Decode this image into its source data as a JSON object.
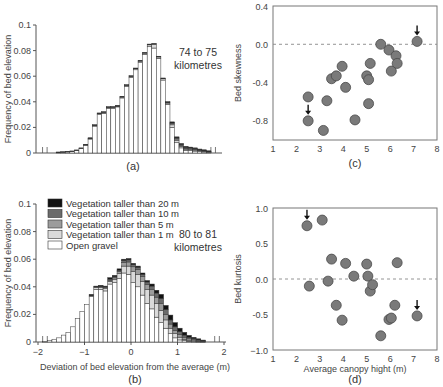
{
  "chart_data": [
    {
      "id": "a",
      "type": "bar",
      "stacked": true,
      "caption": "(a)",
      "annotation": [
        "74 to 75",
        "kilometres"
      ],
      "ylabel": "Frequency of bed elevation",
      "xlabel": "",
      "ylim": [
        0,
        0.1
      ],
      "yticks": [
        "0",
        "0.02",
        "0.04",
        "0.06",
        "0.08",
        "0.1"
      ],
      "xlim": [
        -2,
        2
      ],
      "bin_width": 0.1,
      "x_start": -1.8,
      "series": [
        {
          "name": "Open gravel",
          "values": [
            0,
            0,
            0.0005,
            0.0007,
            0.0009,
            0.0012,
            0.002,
            0.0035,
            0.006,
            0.011,
            0.021,
            0.03,
            0.031,
            0.035,
            0.035,
            0.036,
            0.043,
            0.052,
            0.059,
            0.065,
            0.071,
            0.077,
            0.083,
            0.082,
            0.074,
            0.057,
            0.038,
            0.02,
            0.008,
            0.004,
            0.002,
            0.002,
            0.0015,
            0.001,
            0.0008,
            0.0005,
            0,
            0
          ]
        },
        {
          "name": "Vegetation taller than 1 m",
          "values": [
            0,
            0,
            0,
            0,
            0,
            0,
            0,
            0,
            0.0002,
            0.0003,
            0.0005,
            0.0007,
            0.0007,
            0.0006,
            0.0007,
            0.0006,
            0.0007,
            0.0008,
            0.0008,
            0.0008,
            0.0008,
            0.001,
            0.0015,
            0.003,
            0.001,
            0.001,
            0.001,
            0.002,
            0.002,
            0.001,
            0.001,
            0.0008,
            0.0008,
            0.0006,
            0.0005,
            0.0004,
            0,
            0
          ]
        },
        {
          "name": "Vegetation taller than 5 m",
          "values": [
            0,
            0,
            0,
            0,
            0,
            0,
            0,
            0,
            0,
            0,
            0,
            0,
            0,
            0,
            0,
            0,
            0,
            0,
            0,
            0,
            0,
            0,
            0,
            0,
            0,
            0,
            0.0005,
            0.001,
            0.001,
            0.0008,
            0.0006,
            0.0006,
            0.0005,
            0.0005,
            0.0004,
            0.0003,
            0,
            0
          ]
        },
        {
          "name": "Vegetation taller than 10 m",
          "values": [
            0,
            0,
            0,
            0,
            0,
            0,
            0,
            0,
            0,
            0,
            0,
            0,
            0,
            0,
            0,
            0,
            0,
            0,
            0,
            0,
            0,
            0,
            0,
            0,
            0,
            0,
            0,
            0.0005,
            0.0008,
            0.0008,
            0.0008,
            0.0006,
            0.0006,
            0.0005,
            0.0004,
            0.0002,
            0,
            0
          ]
        },
        {
          "name": "Vegetation taller than 20 m",
          "values": [
            0,
            0,
            0.0003,
            0.0003,
            0.0003,
            0.0004,
            0.0004,
            0.0005,
            0.0006,
            0.0006,
            0.0006,
            0.0006,
            0.0006,
            0.0006,
            0.0006,
            0.0006,
            0.0006,
            0.0006,
            0.0006,
            0.0006,
            0.0006,
            0.0006,
            0.0006,
            0.0006,
            0.0006,
            0.0006,
            0.0006,
            0.0008,
            0.0008,
            0.0008,
            0.0008,
            0.0006,
            0.0006,
            0.0005,
            0.0004,
            0.0003,
            0,
            0
          ]
        }
      ]
    },
    {
      "id": "b",
      "type": "bar",
      "stacked": true,
      "caption": "(b)",
      "annotation": [
        "80 to 81",
        "kilometres"
      ],
      "ylabel": "Frequency of bed elevation",
      "xlabel": "Deviation of bed elevation from the average (m)",
      "ylim": [
        0,
        0.1
      ],
      "yticks": [
        "0",
        "0.02",
        "0.04",
        "0.06",
        "0.08",
        "0.1"
      ],
      "xlim": [
        -2,
        2
      ],
      "xticks": [
        "−2",
        "−1",
        "0",
        "1",
        "2"
      ],
      "bin_width": 0.1,
      "x_start": -1.9,
      "legend": [
        {
          "label": "Vegetation taller than 20 m",
          "color": "#111111"
        },
        {
          "label": "Vegetation taller than 10 m",
          "color": "#6b6b6b"
        },
        {
          "label": "Vegetation taller than 5 m",
          "color": "#9c9c9c"
        },
        {
          "label": "Vegetation taller than 1 m",
          "color": "#dadada"
        },
        {
          "label": "Open gravel",
          "color": "#ffffff"
        }
      ],
      "series": [
        {
          "name": "Open gravel",
          "values": [
            0.0003,
            0.001,
            0.002,
            0.003,
            0.005,
            0.007,
            0.011,
            0.017,
            0.022,
            0.027,
            0.033,
            0.038,
            0.038,
            0.037,
            0.042,
            0.043,
            0.046,
            0.05,
            0.049,
            0.043,
            0.04,
            0.034,
            0.028,
            0.024,
            0.018,
            0.014,
            0.01,
            0.006,
            0.003,
            0.0015,
            0.001,
            0.0005,
            0.0003,
            0.0002,
            0.0001,
            0
          ]
        },
        {
          "name": "Vegetation taller than 1 m",
          "values": [
            0,
            0,
            0,
            0,
            0,
            0,
            0,
            0,
            0,
            0,
            0.0005,
            0.0015,
            0.0015,
            0.002,
            0.002,
            0.0025,
            0.0035,
            0.005,
            0.006,
            0.008,
            0.009,
            0.01,
            0.01,
            0.01,
            0.01,
            0.009,
            0.006,
            0.004,
            0.003,
            0.002,
            0.001,
            0.0008,
            0.0005,
            0.0003,
            0.0002,
            0
          ]
        },
        {
          "name": "Vegetation taller than 5 m",
          "values": [
            0,
            0,
            0,
            0,
            0,
            0,
            0,
            0,
            0,
            0,
            0,
            0,
            0.0005,
            0.0005,
            0.0008,
            0.001,
            0.0015,
            0.0025,
            0.003,
            0.0035,
            0.0035,
            0.0035,
            0.0035,
            0.004,
            0.0045,
            0.005,
            0.004,
            0.003,
            0.0025,
            0.002,
            0.0015,
            0.001,
            0.0008,
            0.0005,
            0.0003,
            0
          ]
        },
        {
          "name": "Vegetation taller than 10 m",
          "values": [
            0,
            0,
            0,
            0,
            0,
            0,
            0,
            0,
            0,
            0,
            0,
            0.0005,
            0.0005,
            0.0005,
            0.0008,
            0.0008,
            0.001,
            0.0015,
            0.0015,
            0.0015,
            0.0015,
            0.0015,
            0.002,
            0.0025,
            0.003,
            0.0035,
            0.0035,
            0.003,
            0.0025,
            0.002,
            0.0015,
            0.001,
            0.0008,
            0.0005,
            0.0003,
            0
          ]
        },
        {
          "name": "Vegetation taller than 20 m",
          "values": [
            0,
            0,
            0,
            0,
            0,
            0,
            0,
            0,
            0,
            0,
            0.001,
            0.0005,
            0.0005,
            0.0005,
            0.001,
            0.001,
            0.001,
            0.001,
            0.001,
            0.001,
            0.001,
            0.001,
            0.001,
            0.0015,
            0.002,
            0.003,
            0.003,
            0.0035,
            0.003,
            0.0025,
            0.002,
            0.0015,
            0.001,
            0.0008,
            0.0005,
            0
          ]
        }
      ]
    },
    {
      "id": "c",
      "type": "scatter",
      "caption": "(c)",
      "ylabel": "Bed skewness",
      "xlabel": "",
      "xlim": [
        1,
        8
      ],
      "ylim": [
        -1.0,
        0.4
      ],
      "xticks": [
        "1",
        "2",
        "3",
        "4",
        "5",
        "6",
        "7",
        "8"
      ],
      "yticks": [
        {
          "v": 0.4,
          "label": "0.4"
        },
        {
          "v": 0.0,
          "label": "0.0"
        },
        {
          "v": -0.4,
          "label": "-0.4"
        },
        {
          "v": -0.8,
          "label": "-0.8"
        }
      ],
      "reference_line": 0.0,
      "points": [
        {
          "x": 2.5,
          "y": -0.55
        },
        {
          "x": 2.5,
          "y": -0.8,
          "arrow": true
        },
        {
          "x": 3.15,
          "y": -0.9
        },
        {
          "x": 3.3,
          "y": -0.59
        },
        {
          "x": 3.5,
          "y": -0.36
        },
        {
          "x": 3.7,
          "y": -0.33
        },
        {
          "x": 3.95,
          "y": -0.23
        },
        {
          "x": 4.1,
          "y": -0.45
        },
        {
          "x": 4.5,
          "y": -0.79
        },
        {
          "x": 5.0,
          "y": -0.33
        },
        {
          "x": 5.08,
          "y": -0.37
        },
        {
          "x": 5.08,
          "y": -0.62
        },
        {
          "x": 5.15,
          "y": -0.2
        },
        {
          "x": 5.6,
          "y": 0.0
        },
        {
          "x": 5.95,
          "y": -0.06
        },
        {
          "x": 6.05,
          "y": -0.28
        },
        {
          "x": 6.25,
          "y": -0.12
        },
        {
          "x": 6.3,
          "y": -0.2
        },
        {
          "x": 7.15,
          "y": 0.03,
          "arrow": true
        }
      ]
    },
    {
      "id": "d",
      "type": "scatter",
      "caption": "(d)",
      "ylabel": "Bed kurtosis",
      "xlabel": "Average canopy hight (m)",
      "xlim": [
        1,
        8
      ],
      "ylim": [
        -1.0,
        1.0
      ],
      "xticks": [
        "1",
        "2",
        "3",
        "4",
        "5",
        "6",
        "7",
        "8"
      ],
      "yticks": [
        {
          "v": 1.0,
          "label": "1.0"
        },
        {
          "v": 0.5,
          "label": "0.5"
        },
        {
          "v": 0.0,
          "label": "0.0"
        },
        {
          "v": -0.5,
          "label": "-0.5"
        },
        {
          "v": -1.0,
          "label": "−1.0"
        }
      ],
      "reference_line": 0.0,
      "points": [
        {
          "x": 2.45,
          "y": 0.75,
          "arrow": true
        },
        {
          "x": 2.55,
          "y": -0.1
        },
        {
          "x": 3.1,
          "y": 0.83
        },
        {
          "x": 3.35,
          "y": -0.03
        },
        {
          "x": 3.5,
          "y": 0.28
        },
        {
          "x": 3.7,
          "y": -0.37
        },
        {
          "x": 3.95,
          "y": -0.58
        },
        {
          "x": 4.1,
          "y": 0.22
        },
        {
          "x": 4.45,
          "y": 0.04
        },
        {
          "x": 5.0,
          "y": 0.21
        },
        {
          "x": 5.05,
          "y": 0.04
        },
        {
          "x": 5.15,
          "y": -0.17
        },
        {
          "x": 5.25,
          "y": -0.08
        },
        {
          "x": 5.6,
          "y": -0.8
        },
        {
          "x": 5.95,
          "y": -0.57
        },
        {
          "x": 6.05,
          "y": -0.55
        },
        {
          "x": 6.2,
          "y": -0.37
        },
        {
          "x": 6.3,
          "y": 0.23
        },
        {
          "x": 7.15,
          "y": -0.52,
          "arrow": true
        }
      ]
    }
  ],
  "colors": {
    "Open gravel": "#ffffff",
    "Vegetation taller than 1 m": "#dadada",
    "Vegetation taller than 5 m": "#9c9c9c",
    "Vegetation taller than 10 m": "#6b6b6b",
    "Vegetation taller than 20 m": "#111111",
    "point_fill": "#7a7a7a",
    "point_stroke": "#4a4a4a",
    "axis": "#555555"
  }
}
